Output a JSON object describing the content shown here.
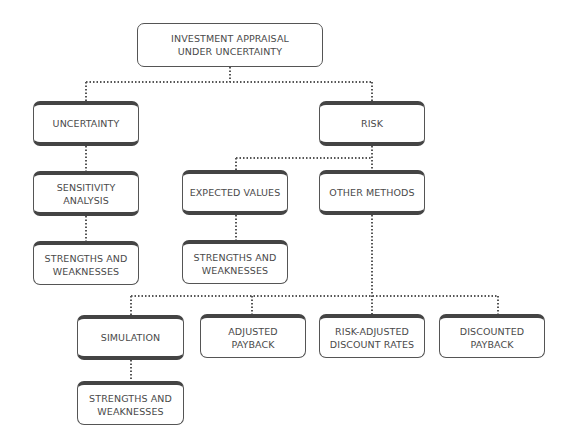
{
  "diagram": {
    "root": {
      "label": "INVESTMENT APPRAISAL\nUNDER UNCERTAINTY"
    },
    "uncertainty": {
      "label": "UNCERTAINTY",
      "sensitivity": {
        "label": "SENSITIVITY\nANALYSIS"
      },
      "strengths": {
        "label": "STRENGTHS AND\nWEAKNESSES"
      }
    },
    "risk": {
      "label": "RISK",
      "expected_values": {
        "label": "EXPECTED VALUES"
      },
      "ev_strengths": {
        "label": "STRENGTHS AND\nWEAKNESSES"
      },
      "other_methods": {
        "label": "OTHER METHODS"
      },
      "simulation": {
        "label": "SIMULATION"
      },
      "sim_strengths": {
        "label": "STRENGTHS AND\nWEAKNESSES"
      },
      "adjusted_payback": {
        "label": "ADJUSTED\nPAYBACK"
      },
      "risk_adjusted": {
        "label": "RISK-ADJUSTED\nDISCOUNT RATES"
      },
      "discounted_payback": {
        "label": "DISCOUNTED\nPAYBACK"
      }
    }
  },
  "colors": {
    "border": "#555555",
    "text": "#4a4a4a",
    "background": "#ffffff"
  }
}
